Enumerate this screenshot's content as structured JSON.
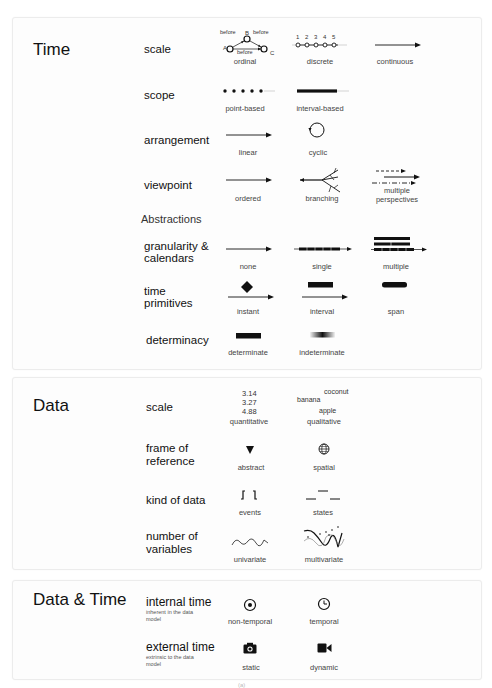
{
  "sections": {
    "time": {
      "title": "Time",
      "rows": {
        "scale": {
          "label": "scale",
          "options": [
            "ordinal",
            "discrete",
            "continuous"
          ],
          "ordinal_diagram": {
            "nodes": [
              "A",
              "B",
              "C"
            ],
            "edge_label": "before"
          },
          "discrete_ticks": [
            "1",
            "2",
            "3",
            "4",
            "5"
          ]
        },
        "scope": {
          "label": "scope",
          "options": [
            "point-based",
            "interval-based"
          ]
        },
        "arrangement": {
          "label": "arrangement",
          "options": [
            "linear",
            "cyclic"
          ]
        },
        "viewpoint": {
          "label": "viewpoint",
          "options": [
            "ordered",
            "branching",
            "multiple",
            "perspectives"
          ]
        }
      },
      "abstractions_heading": "Abstractions",
      "abstractions": {
        "granularity": {
          "label_line1": "granularity &",
          "label_line2": "calendars",
          "options": [
            "none",
            "single",
            "multiple"
          ]
        },
        "primitives": {
          "label_line1": "time",
          "label_line2": "primitives",
          "options": [
            "instant",
            "interval",
            "span"
          ]
        },
        "determinacy": {
          "label": "determinacy",
          "options": [
            "determinate",
            "indeterminate"
          ]
        }
      }
    },
    "data": {
      "title": "Data",
      "rows": {
        "scale": {
          "label": "scale",
          "options": [
            "quantitative",
            "qualitative"
          ],
          "quantitative_values": [
            "3.14",
            "3.27",
            "4.88"
          ],
          "qualitative_values": [
            "coconut",
            "banana",
            "apple"
          ]
        },
        "frame": {
          "label_line1": "frame of",
          "label_line2": "reference",
          "options": [
            "abstract",
            "spatial"
          ]
        },
        "kind": {
          "label": "kind of data",
          "options": [
            "events",
            "states"
          ]
        },
        "variables": {
          "label_line1": "number of",
          "label_line2": "variables",
          "options": [
            "univariate",
            "multivariate"
          ]
        }
      }
    },
    "data_time": {
      "title": "Data & Time",
      "rows": {
        "internal": {
          "label": "internal time",
          "note_line1": "inherent in the data",
          "note_line2": "model",
          "options": [
            "non-temporal",
            "temporal"
          ]
        },
        "external": {
          "label": "external time",
          "note_line1": "extrinsic to the data",
          "note_line2": "model",
          "options": [
            "static",
            "dynamic"
          ]
        }
      }
    }
  },
  "footer_mark": "(a)"
}
